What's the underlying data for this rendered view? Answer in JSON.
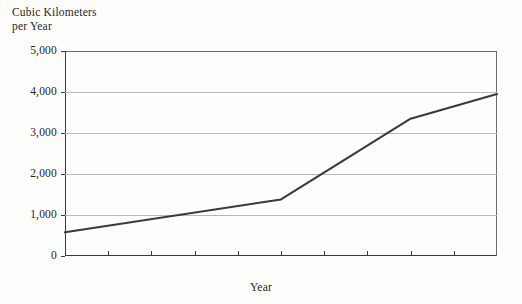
{
  "figure": {
    "y_axis_title": "Cubic Kilometers\nper Year",
    "x_axis_title": "Year",
    "line_color": "#3a3a3a",
    "grid_color": "#b8b8b8",
    "axis_color": "#3a3a3a",
    "background_color": "#fdfdfb"
  },
  "axes": {
    "y_ticks": [
      {
        "label": "5,000",
        "value": 5000
      },
      {
        "label": "4,000",
        "value": 4000
      },
      {
        "label": "3,000",
        "value": 3000
      },
      {
        "label": "2,000",
        "value": 2000
      },
      {
        "label": "1,000",
        "value": 1000
      },
      {
        "label": "0",
        "value": 0
      }
    ],
    "x_ticks": [
      {
        "label": "1900",
        "value": 1900
      },
      {
        "label": "1920",
        "value": 1920
      },
      {
        "label": "1940",
        "value": 1940
      },
      {
        "label": "1960",
        "value": 1960
      },
      {
        "label": "1980",
        "value": 1980
      },
      {
        "label": "2000",
        "value": 2000
      }
    ],
    "x_minor_ticks": [
      1910,
      1920,
      1930,
      1940,
      1950,
      1960,
      1970,
      1980,
      1990
    ]
  },
  "chart_data": {
    "type": "line",
    "title": "",
    "subtitle": "",
    "xlabel": "Year",
    "ylabel": "Cubic Kilometers per Year",
    "xlim": [
      1900,
      2000
    ],
    "ylim": [
      0,
      5000
    ],
    "grid": true,
    "grid_axis": "y",
    "legend": false,
    "yticks": [
      0,
      1000,
      2000,
      3000,
      4000,
      5000
    ],
    "ytick_labels": [
      "0",
      "1,000",
      "2,000",
      "3,000",
      "4,000",
      "5,000"
    ],
    "xticks": [
      1900,
      1920,
      1940,
      1960,
      1980,
      2000
    ],
    "xtick_labels": [
      "1900",
      "1920",
      "1940",
      "1960",
      "1980",
      "2000"
    ],
    "series": [
      {
        "name": "World water withdrawal",
        "color": "#3a3a3a",
        "x": [
          1900,
          1950,
          1980,
          2000
        ],
        "values": [
          580,
          1380,
          3350,
          3950
        ]
      }
    ]
  }
}
